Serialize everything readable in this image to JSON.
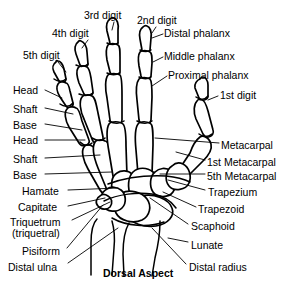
{
  "figure": {
    "caption": "Dorsal Aspect",
    "caption_x": 103,
    "caption_y": 267,
    "line_color": "#000000",
    "background_color": "#ffffff"
  },
  "labels": [
    {
      "name": "digit-5",
      "text": "5th digit",
      "x": 23,
      "y": 50,
      "align": "left"
    },
    {
      "name": "digit-4",
      "text": "4th digit",
      "x": 52,
      "y": 28,
      "align": "left"
    },
    {
      "name": "digit-3",
      "text": "3rd digit",
      "x": 84,
      "y": 10,
      "align": "left"
    },
    {
      "name": "digit-2",
      "text": "2nd digit",
      "x": 137,
      "y": 15,
      "align": "left"
    },
    {
      "name": "digit-1",
      "text": "1st digit",
      "x": 220,
      "y": 90,
      "align": "left"
    },
    {
      "name": "distal-phalanx",
      "text": "Distal phalanx",
      "x": 164,
      "y": 28,
      "align": "left"
    },
    {
      "name": "middle-phalanx",
      "text": "Middle phalanx",
      "x": 164,
      "y": 51,
      "align": "left"
    },
    {
      "name": "proximal-phalanx",
      "text": "Proximal phalanx",
      "x": 168,
      "y": 70,
      "align": "left"
    },
    {
      "name": "head-upper",
      "text": "Head",
      "x": 13,
      "y": 85,
      "align": "left"
    },
    {
      "name": "shaft-upper",
      "text": "Shaft",
      "x": 13,
      "y": 104,
      "align": "left"
    },
    {
      "name": "base-upper",
      "text": "Base",
      "x": 13,
      "y": 120,
      "align": "left"
    },
    {
      "name": "head-lower",
      "text": "Head",
      "x": 13,
      "y": 135,
      "align": "left"
    },
    {
      "name": "shaft-lower",
      "text": "Shaft",
      "x": 13,
      "y": 154,
      "align": "left"
    },
    {
      "name": "base-lower",
      "text": "Base",
      "x": 13,
      "y": 170,
      "align": "left"
    },
    {
      "name": "hamate",
      "text": "Hamate",
      "x": 22,
      "y": 186,
      "align": "left"
    },
    {
      "name": "capitate",
      "text": "Capitate",
      "x": 18,
      "y": 202,
      "align": "left"
    },
    {
      "name": "triquetrum-line1",
      "text": "Triquetrum",
      "x": 10,
      "y": 217,
      "align": "left"
    },
    {
      "name": "triquetrum-line2",
      "text": "(triquetral)",
      "x": 12,
      "y": 228,
      "align": "left"
    },
    {
      "name": "pisiform",
      "text": "Pisiform",
      "x": 22,
      "y": 246,
      "align": "left"
    },
    {
      "name": "distal-ulna",
      "text": "Distal ulna",
      "x": 8,
      "y": 262,
      "align": "left"
    },
    {
      "name": "metacarpal",
      "text": "Metacarpal",
      "x": 221,
      "y": 140,
      "align": "left"
    },
    {
      "name": "metacarpal-1st",
      "text": "1st Metacarpal",
      "x": 207,
      "y": 157,
      "align": "left"
    },
    {
      "name": "metacarpal-5th",
      "text": "5th Metacarpal",
      "x": 207,
      "y": 171,
      "align": "left"
    },
    {
      "name": "trapezium",
      "text": "Trapezium",
      "x": 208,
      "y": 187,
      "align": "left"
    },
    {
      "name": "trapezoid",
      "text": "Trapezoid",
      "x": 198,
      "y": 204,
      "align": "left"
    },
    {
      "name": "scaphoid",
      "text": "Scaphoid",
      "x": 191,
      "y": 221,
      "align": "left"
    },
    {
      "name": "lunate",
      "text": "Lunate",
      "x": 191,
      "y": 240,
      "align": "left"
    },
    {
      "name": "distal-radius",
      "text": "Distal radius",
      "x": 189,
      "y": 262,
      "align": "left"
    }
  ],
  "leaders": [
    {
      "name": "leader-digit-5",
      "d": "M 58 62 L 66 72"
    },
    {
      "name": "leader-digit-4",
      "d": "M 88 40 L 82 48"
    },
    {
      "name": "leader-digit-3",
      "d": "M 114 22 L 112 30"
    },
    {
      "name": "leader-digit-2",
      "d": "M 156 27 L 152 33"
    },
    {
      "name": "leader-digit-1",
      "d": "M 218 96 L 208 100"
    },
    {
      "name": "leader-distal-phalanx",
      "d": "M 163 34 L 152 38"
    },
    {
      "name": "leader-middle-phalanx",
      "d": "M 163 57 L 153 62"
    },
    {
      "name": "leader-proximal-phalanx",
      "d": "M 167 76 L 152 86"
    },
    {
      "name": "leader-head-upper",
      "d": "M 45 90 L 62 98"
    },
    {
      "name": "leader-shaft-upper",
      "d": "M 45 108 L 73 114"
    },
    {
      "name": "leader-base-upper",
      "d": "M 45 124 L 82 130"
    },
    {
      "name": "leader-head-lower",
      "d": "M 45 140 L 85 140"
    },
    {
      "name": "leader-shaft-lower",
      "d": "M 45 158 L 100 155"
    },
    {
      "name": "leader-base-lower",
      "d": "M 45 174 L 112 172"
    },
    {
      "name": "leader-hamate",
      "d": "M 68 190 L 118 188"
    },
    {
      "name": "leader-capitate",
      "d": "M 68 206 L 105 198"
    },
    {
      "name": "leader-triquetrum",
      "d": "M 72 220 L 110 202"
    },
    {
      "name": "leader-pisiform",
      "d": "M 67 248 L 103 205"
    },
    {
      "name": "leader-distal-ulna",
      "d": "M 68 263 L 118 228"
    },
    {
      "name": "leader-metacarpal",
      "d": "M 219 143 L 155 138"
    },
    {
      "name": "leader-metacarpal-1st",
      "d": "M 205 160 L 176 152"
    },
    {
      "name": "leader-metacarpal-5th",
      "d": "M 205 174 L 160 174"
    },
    {
      "name": "leader-trapezium",
      "d": "M 205 190 L 168 180"
    },
    {
      "name": "leader-trapezoid",
      "d": "M 196 207 L 163 192"
    },
    {
      "name": "leader-scaphoid",
      "d": "M 188 224 L 150 198"
    },
    {
      "name": "leader-lunate",
      "d": "M 188 242 L 168 238"
    },
    {
      "name": "leader-distal-radius",
      "d": "M 186 264 L 152 228"
    }
  ],
  "bones": {
    "digit2": [
      {
        "name": "bone-distal-phalanx-d2",
        "d": "M 143 27 C 140 29 139 34 140 39 L 142 50 C 143 53 149 53 150 50 L 151 38 C 152 32 150 27 147 26 C 145 25 144 26 143 27 Z"
      },
      {
        "name": "bone-middle-phalanx-d2",
        "d": "M 140 52 C 138 55 138 60 139 66 L 141 76 C 142 80 150 80 151 76 L 152 63 C 152 57 152 53 150 52 C 147 50 142 50 140 52 Z"
      },
      {
        "name": "bone-proximal-phalanx-d2",
        "d": "M 139 79 C 136 83 136 92 137 100 L 139 120 C 140 126 150 126 151 120 L 152 97 C 152 87 152 81 150 79 C 147 77 141 77 139 79 Z"
      },
      {
        "name": "bone-metacarpal-d2",
        "d": "M 138 124 C 135 128 135 140 136 150 L 138 174 C 139 181 151 181 152 174 L 153 145 C 153 133 153 126 151 124 C 148 121 140 121 138 124 Z"
      }
    ],
    "digit3": [
      {
        "name": "bone-distal-phalanx-d3",
        "d": "M 110 19 C 107 21 106 26 107 31 L 110 43 C 111 46 117 46 118 43 L 118 30 C 119 24 117 19 114 18 C 112 17 111 18 110 19 Z"
      },
      {
        "name": "bone-middle-phalanx-d3",
        "d": "M 108 45 C 106 48 106 54 107 60 L 110 72 C 111 76 119 76 120 72 L 120 57 C 120 50 120 46 118 45 C 115 43 110 43 108 45 Z"
      },
      {
        "name": "bone-proximal-phalanx-d3",
        "d": "M 108 75 C 105 79 105 89 107 98 L 110 120 C 111 127 121 127 122 120 L 122 95 C 122 84 122 77 120 75 C 117 73 110 73 108 75 Z"
      },
      {
        "name": "bone-metacarpal-d3",
        "d": "M 109 124 C 106 129 107 141 109 152 L 113 176 C 114 183 126 183 127 176 L 126 146 C 126 134 125 126 123 124 C 120 121 111 121 109 124 Z"
      }
    ],
    "digit4": [
      {
        "name": "bone-distal-phalanx-d4",
        "d": "M 78 42 C 75 44 74 49 76 54 L 80 65 C 82 68 88 67 88 64 L 87 52 C 87 46 84 42 81 41 C 79 40 79 41 78 42 Z"
      },
      {
        "name": "bone-middle-phalanx-d4",
        "d": "M 78 68 C 76 71 77 77 79 83 L 84 94 C 86 98 93 96 93 92 L 91 78 C 90 72 89 68 87 67 C 84 65 79 66 78 68 Z"
      },
      {
        "name": "bone-proximal-phalanx-d4",
        "d": "M 82 97 C 79 101 80 111 84 119 L 92 139 C 94 146 104 143 103 137 L 98 113 C 96 103 95 97 92 96 C 89 94 83 95 82 97 Z"
      },
      {
        "name": "bone-metacarpal-d4",
        "d": "M 95 142 C 92 147 94 158 98 168 L 107 190 C 110 196 121 193 119 186 L 112 158 C 110 147 108 141 105 141 C 102 139 96 140 95 142 Z"
      }
    ],
    "digit5": [
      {
        "name": "bone-distal-phalanx-d5",
        "d": "M 56 62 C 53 64 52 68 54 72 L 59 81 C 61 84 66 82 66 79 L 64 69 C 63 64 60 61 58 61 C 56 60 56 61 56 62 Z"
      },
      {
        "name": "bone-middle-phalanx-d5",
        "d": "M 58 84 C 56 87 57 92 60 97 L 66 106 C 68 109 74 107 73 103 L 70 91 C 69 86 68 83 66 83 C 63 81 59 82 58 84 Z"
      },
      {
        "name": "bone-proximal-phalanx-d5",
        "d": "M 67 109 C 64 112 65 120 69 127 L 79 143 C 82 148 91 145 89 140 L 82 121 C 80 113 78 108 76 108 C 73 106 68 107 67 109 Z"
      },
      {
        "name": "bone-metacarpal-d5",
        "d": "M 84 147 C 81 151 83 160 88 169 L 100 190 C 103 196 113 192 110 186 L 100 161 C 97 152 95 147 92 146 C 89 144 85 145 84 147 Z"
      }
    ],
    "digit1": [
      {
        "name": "bone-distal-phalanx-d1",
        "d": "M 200 79 C 197 80 194 84 195 88 L 199 98 C 201 102 208 100 208 96 L 208 85 C 208 80 205 77 203 77 C 201 77 201 78 200 79 Z"
      },
      {
        "name": "bone-proximal-phalanx-d1",
        "d": "M 197 101 C 194 104 193 112 196 119 L 203 134 C 206 140 215 136 213 130 L 208 111 C 206 104 204 100 202 100 C 199 99 198 99 197 101 Z"
      },
      {
        "name": "bone-metacarpal-d1",
        "d": "M 200 137 C 196 140 192 147 190 153 L 180 168 C 176 174 183 180 188 176 L 203 161 C 210 154 212 148 211 144 C 209 137 203 135 200 137 Z"
      }
    ],
    "carpals": [
      {
        "name": "bone-hamate",
        "d": "M 117 173 C 112 176 110 184 113 191 C 116 198 127 199 132 194 C 137 189 137 178 132 174 C 128 170 121 170 117 173 Z"
      },
      {
        "name": "bone-capitate",
        "d": "M 133 172 C 128 177 127 188 131 196 C 135 204 150 205 155 198 C 160 191 159 177 153 172 C 147 167 138 167 133 172 Z"
      },
      {
        "name": "bone-trapezoid",
        "d": "M 155 172 C 150 176 149 186 153 192 C 157 198 169 198 173 192 C 177 186 176 175 171 171 C 166 167 159 168 155 172 Z"
      },
      {
        "name": "bone-trapezium",
        "d": "M 172 166 C 166 170 164 180 169 186 C 174 192 186 190 189 183 C 192 176 189 167 183 164 C 179 162 175 163 172 166 Z"
      },
      {
        "name": "bone-scaphoid",
        "d": "M 141 196 C 132 199 126 207 128 215 C 130 223 144 228 156 226 C 168 224 175 216 172 208 C 169 199 154 193 141 196 Z"
      },
      {
        "name": "bone-lunate",
        "d": "M 122 193 C 115 197 112 206 116 213 C 120 221 133 224 142 220 C 150 216 152 206 147 199 C 142 192 129 189 122 193 Z"
      },
      {
        "name": "bone-triquetrum",
        "d": "M 107 189 C 101 192 99 200 103 206 C 107 212 117 213 122 208 C 127 203 126 194 121 190 C 117 187 111 186 107 189 Z"
      },
      {
        "name": "bone-pisiform",
        "d": "M 100 196 C 96 198 95 203 98 206 C 101 210 107 210 110 207 C 113 203 112 198 108 196 C 105 194 102 194 100 196 Z"
      }
    ],
    "forearm": [
      {
        "name": "bone-distal-ulna",
        "d": "M 97 219 C 93 223 91 232 91 243 L 91 275 M 112 221 C 114 228 115 238 114 248 L 112 275"
      },
      {
        "name": "bone-distal-radius",
        "d": "M 129 223 C 125 230 123 242 123 254 L 124 276 M 160 221 C 160 232 158 246 155 258 L 152 276"
      }
    ],
    "detail_lines": [
      {
        "name": "joint-line-d2-dip",
        "d": "M 140 50 C 144 52 148 52 151 50"
      },
      {
        "name": "joint-line-d2-pip",
        "d": "M 139 77 C 143 79 148 79 151 77"
      },
      {
        "name": "joint-line-d2-mcp",
        "d": "M 137 121 C 142 124 148 124 152 121"
      },
      {
        "name": "joint-line-d3-dip",
        "d": "M 107 43 C 111 45 115 45 118 43"
      },
      {
        "name": "joint-line-d3-pip",
        "d": "M 107 73 C 111 75 116 75 120 73"
      },
      {
        "name": "joint-line-d3-mcp",
        "d": "M 109 121 C 114 124 120 124 124 121"
      },
      {
        "name": "joint-line-d4-dip",
        "d": "M 76 65 C 80 67 85 67 88 64"
      },
      {
        "name": "joint-line-d4-pip",
        "d": "M 79 94 C 84 96 89 96 93 93"
      },
      {
        "name": "joint-line-d4-mcp",
        "d": "M 92 138 C 97 141 102 141 105 138"
      },
      {
        "name": "joint-line-d5-dip",
        "d": "M 54 79 C 58 82 63 82 66 79"
      },
      {
        "name": "joint-line-d5-pip",
        "d": "M 60 104 C 64 107 70 107 73 103"
      },
      {
        "name": "joint-line-d5-mcp",
        "d": "M 80 142 C 84 146 89 146 92 143"
      },
      {
        "name": "joint-line-d1-ip",
        "d": "M 196 97 C 200 100 205 100 208 96"
      },
      {
        "name": "joint-line-d1-mcp",
        "d": "M 199 134 C 203 137 208 137 212 134"
      },
      {
        "name": "cmc-line",
        "d": "M 108 184 C 124 178 145 175 166 176 C 176 177 184 179 190 182"
      },
      {
        "name": "midcarpal-line",
        "d": "M 104 201 C 118 194 138 192 152 194 C 164 196 172 202 176 208"
      },
      {
        "name": "radiocarpal-line",
        "d": "M 112 218 C 126 226 148 228 164 222"
      }
    ]
  }
}
